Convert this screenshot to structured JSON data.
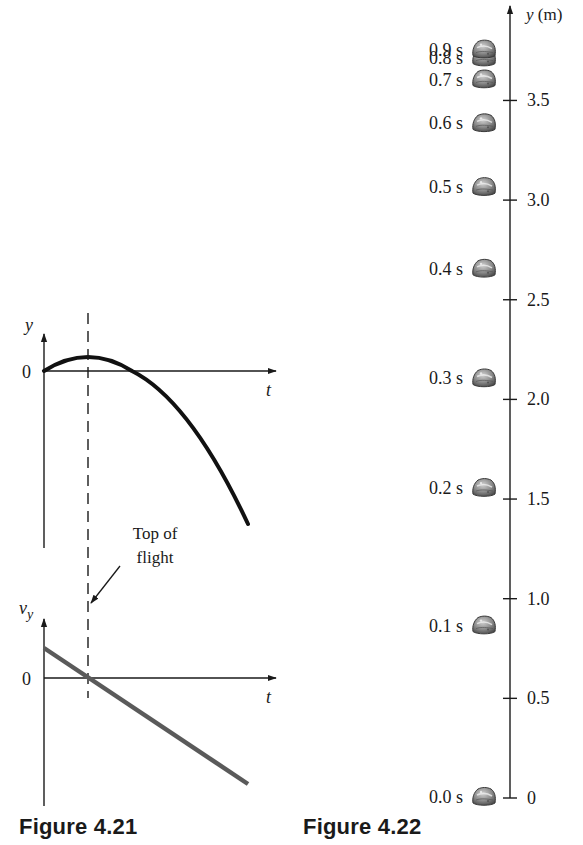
{
  "figures": [
    {
      "id": "fig-4-21",
      "caption": "Figure 4.21",
      "position_graph": {
        "y_axis_label": "y",
        "x_axis_label": "t",
        "origin_label": "0"
      },
      "velocity_graph": {
        "y_axis_label_main": "v",
        "y_axis_label_sub": "y",
        "x_axis_label": "t",
        "origin_label": "0"
      },
      "annotation": {
        "line1": "Top of",
        "line2": "flight"
      }
    },
    {
      "id": "fig-4-22",
      "caption": "Figure 4.22",
      "axis_label": "y (m)",
      "axis_label_var": "y",
      "axis_label_unit": " (m)"
    }
  ],
  "chart_data": [
    {
      "type": "line",
      "title": "Figure 4.21 (top): position vs time",
      "xlabel": "t",
      "ylabel": "y",
      "grid": false,
      "description": "Parabola starting at y = 0, rising to a maximum (top of flight, marked by dashed vertical line), then falling below zero",
      "series": [
        {
          "name": "y(t)",
          "shape": "downward parabola",
          "points_normalized": [
            [
              0,
              0
            ],
            [
              1,
              1
            ],
            [
              2,
              0
            ],
            [
              3,
              -2.2
            ],
            [
              3.6,
              -4.3
            ]
          ]
        }
      ],
      "marker": {
        "type": "dashed-vertical",
        "at_t": 1,
        "label": "Top of flight"
      }
    },
    {
      "type": "line",
      "title": "Figure 4.21 (bottom): vertical velocity vs time",
      "xlabel": "t",
      "ylabel": "v_y",
      "grid": false,
      "description": "Straight line with negative slope crossing zero at the top of flight",
      "series": [
        {
          "name": "v_y(t)",
          "shape": "linear decreasing",
          "points_normalized": [
            [
              0,
              1
            ],
            [
              1,
              0
            ],
            [
              3.6,
              -2.6
            ]
          ]
        }
      ]
    },
    {
      "type": "scatter",
      "title": "Figure 4.22: rock positions at 0.1 s intervals",
      "xlabel": "",
      "ylabel": "y (m)",
      "ylim": [
        0,
        3.9
      ],
      "y_ticks": [
        0,
        0.5,
        1.0,
        1.5,
        2.0,
        2.5,
        3.0,
        3.5
      ],
      "y_tick_labels": [
        "0",
        "0.5",
        "1.0",
        "1.5",
        "2.0",
        "2.5",
        "3.0",
        "3.5"
      ],
      "grid": false,
      "points": [
        {
          "label": "0.0 s",
          "t": 0.0,
          "y": 0.0
        },
        {
          "label": "0.1 s",
          "t": 0.1,
          "y": 0.86
        },
        {
          "label": "0.2 s",
          "t": 0.2,
          "y": 1.55
        },
        {
          "label": "0.3 s",
          "t": 0.3,
          "y": 2.1
        },
        {
          "label": "0.4 s",
          "t": 0.4,
          "y": 2.65
        },
        {
          "label": "0.5 s",
          "t": 0.5,
          "y": 3.06
        },
        {
          "label": "0.6 s",
          "t": 0.6,
          "y": 3.38
        },
        {
          "label": "0.7 s",
          "t": 0.7,
          "y": 3.6
        },
        {
          "label": "0.8 s",
          "t": 0.8,
          "y": 3.71
        },
        {
          "label": "0.9 s",
          "t": 0.9,
          "y": 3.75
        }
      ]
    }
  ]
}
